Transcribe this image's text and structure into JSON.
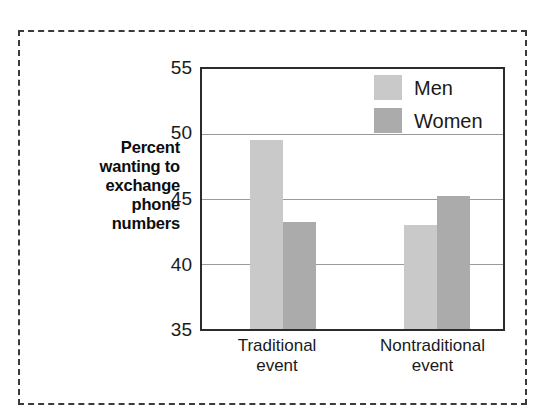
{
  "figure": {
    "border_style": "dashed",
    "border_color": "#3a3a3a",
    "background": "#ffffff"
  },
  "axis_title": {
    "lines": [
      "Percent",
      "wanting to",
      "exchange",
      "phone",
      "numbers"
    ]
  },
  "legend": {
    "entries": [
      {
        "label": "Men",
        "color": "#c9c9c9",
        "swatch_name": "legend-swatch-men"
      },
      {
        "label": "Women",
        "color": "#ababab",
        "swatch_name": "legend-swatch-women"
      }
    ]
  },
  "y_axis": {
    "ticks": [
      "55",
      "50",
      "45",
      "40",
      "35"
    ]
  },
  "categories_display": [
    {
      "line1": "Traditional",
      "line2": "event"
    },
    {
      "line1": "Nontraditional",
      "line2": "event"
    }
  ],
  "chart_data": {
    "type": "bar",
    "title": "",
    "subtitle": "",
    "xlabel": "",
    "ylabel": "Percent wanting to exchange phone numbers",
    "categories": [
      "Traditional event",
      "Nontraditional event"
    ],
    "series": [
      {
        "name": "Men",
        "values": [
          49.5,
          43.0
        ],
        "color": "#c9c9c9"
      },
      {
        "name": "Women",
        "values": [
          43.2,
          45.2
        ],
        "color": "#ababab"
      }
    ],
    "ylim": [
      35,
      55
    ],
    "ytick_values": [
      35,
      40,
      45,
      50,
      55
    ],
    "grid": true,
    "gridline_values": [
      40,
      45,
      50
    ],
    "legend_position": "top-right",
    "bar_grouping": "grouped-adjacent"
  }
}
